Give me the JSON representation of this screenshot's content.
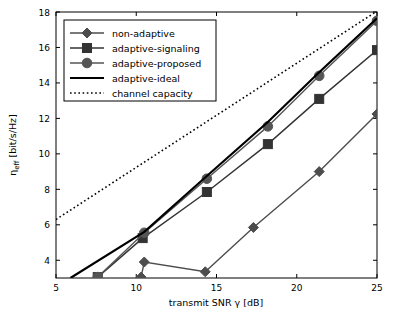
{
  "chart_data": {
    "type": "line",
    "title": "",
    "xlabel": "transmit SNR γ [dB]",
    "ylabel": "η_eff [bit/s/Hz]",
    "xlim": [
      5,
      25
    ],
    "ylim": [
      3,
      18
    ],
    "xticks": [
      5,
      10,
      15,
      20,
      25
    ],
    "yticks": [
      4,
      6,
      8,
      10,
      12,
      14,
      16,
      18
    ],
    "grid": false,
    "legend_position": "upper left",
    "series": [
      {
        "name": "non-adaptive",
        "style": "solid",
        "marker": "diamond",
        "color": "#4d4d4d",
        "x": [
          10.3,
          10.5,
          14.3,
          17.3,
          21.4,
          25.0
        ],
        "y": [
          3.05,
          3.9,
          3.35,
          5.85,
          9.0,
          12.25
        ]
      },
      {
        "name": "adaptive-signaling",
        "style": "solid",
        "marker": "square",
        "color": "#333333",
        "x": [
          7.6,
          10.4,
          14.4,
          18.2,
          21.4,
          25.0
        ],
        "y": [
          3.05,
          5.25,
          7.85,
          10.55,
          13.1,
          15.85
        ]
      },
      {
        "name": "adaptive-proposed",
        "style": "solid",
        "marker": "circle",
        "color": "#555555",
        "x": [
          7.6,
          10.5,
          14.4,
          18.2,
          21.4,
          25.0
        ],
        "y": [
          3.05,
          5.55,
          8.6,
          11.55,
          14.4,
          17.5
        ]
      },
      {
        "name": "adaptive-ideal",
        "style": "solid",
        "marker": "none",
        "color": "#000000",
        "x": [
          5.9,
          10.5,
          14.4,
          18.2,
          21.4,
          25.0
        ],
        "y": [
          3.0,
          5.6,
          8.75,
          11.8,
          14.6,
          17.65
        ]
      },
      {
        "name": "channel capacity",
        "style": "dotted",
        "marker": "none",
        "color": "#000000",
        "x": [
          5.0,
          25.0
        ],
        "y": [
          6.3,
          18.05
        ]
      }
    ]
  },
  "legend": {
    "items": [
      {
        "label": "non-adaptive",
        "marker": "diamond",
        "style": "solid"
      },
      {
        "label": "adaptive-signaling",
        "marker": "square",
        "style": "solid"
      },
      {
        "label": "adaptive-proposed",
        "marker": "circle",
        "style": "solid"
      },
      {
        "label": "adaptive-ideal",
        "marker": "none",
        "style": "solid"
      },
      {
        "label": "channel capacity",
        "marker": "none",
        "style": "dotted"
      }
    ]
  },
  "axes": {
    "xlabel": "transmit SNR γ [dB]",
    "ylabel_main": "η",
    "ylabel_sub": "eff",
    "ylabel_unit": " [bit/s/Hz]",
    "xticks": [
      "5",
      "10",
      "15",
      "20",
      "25"
    ],
    "yticks": [
      "4",
      "6",
      "8",
      "10",
      "12",
      "14",
      "16",
      "18"
    ]
  }
}
